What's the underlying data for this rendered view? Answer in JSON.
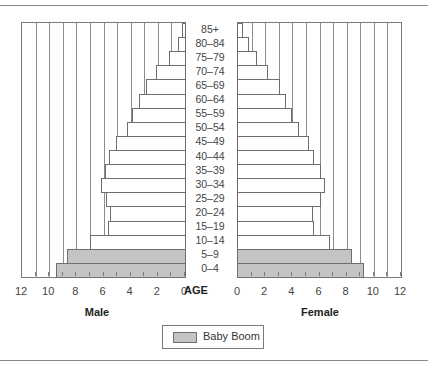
{
  "chart_data": {
    "type": "bar",
    "subtype": "population-pyramid",
    "title": "",
    "xlabel_left": "Male",
    "xlabel_right": "Female",
    "center_label": "AGE",
    "categories": [
      "85+",
      "80–84",
      "75–79",
      "70–74",
      "65–69",
      "60–64",
      "55–59",
      "50–54",
      "45–49",
      "40–44",
      "35–39",
      "30–34",
      "25–29",
      "20–24",
      "15–19",
      "10–14",
      "5–9",
      "0–4"
    ],
    "series": [
      {
        "name": "Male",
        "values": [
          0.2,
          0.5,
          1.2,
          2.1,
          2.9,
          3.4,
          3.9,
          4.3,
          5.1,
          5.6,
          5.9,
          6.2,
          5.8,
          5.5,
          5.7,
          7.0,
          8.7,
          9.5
        ]
      },
      {
        "name": "Female",
        "values": [
          0.4,
          0.8,
          1.4,
          2.2,
          3.1,
          3.5,
          4.0,
          4.5,
          5.2,
          5.6,
          6.1,
          6.4,
          6.1,
          5.5,
          5.6,
          6.8,
          8.4,
          9.3
        ]
      }
    ],
    "highlight": {
      "label": "Baby Boom",
      "categories": [
        "5–9",
        "0–4"
      ],
      "color": "#c4c4c4"
    },
    "xlim": [
      0,
      12
    ],
    "tick_labels": [
      "0",
      "2",
      "4",
      "6",
      "8",
      "10",
      "12"
    ],
    "grid": "vertical lines every 1 unit",
    "legend": {
      "position": "bottom-center",
      "entries": [
        "Baby Boom"
      ]
    }
  },
  "labels": {
    "age": "AGE",
    "male": "Male",
    "female": "Female",
    "legend": "Baby Boom"
  },
  "colors": {
    "bar_default": "#ffffff",
    "bar_highlight": "#c4c4c4",
    "border": "#6e6e6e",
    "grid": "#8c8c8c"
  }
}
